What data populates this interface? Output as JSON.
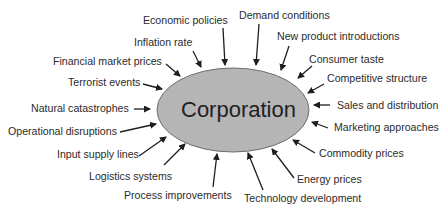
{
  "diagram": {
    "center": {
      "label": "Corporation",
      "fill": "#b5b5b5",
      "stroke": "#6e6e6e"
    },
    "arrow_color": "#1e1e1e",
    "factors": [
      {
        "id": "economic-policies",
        "label": "Economic policies"
      },
      {
        "id": "demand-conditions",
        "label": "Demand conditions"
      },
      {
        "id": "inflation-rate",
        "label": "Inflation rate"
      },
      {
        "id": "new-product-introductions",
        "label": "New product introductions"
      },
      {
        "id": "financial-market-prices",
        "label": "Financial market prices"
      },
      {
        "id": "consumer-taste",
        "label": "Consumer taste"
      },
      {
        "id": "competitive-structure",
        "label": "Competitive structure"
      },
      {
        "id": "terrorist-events",
        "label": "Terrorist events"
      },
      {
        "id": "sales-and-distribution",
        "label": "Sales and distribution"
      },
      {
        "id": "natural-catastrophes",
        "label": "Natural catastrophes"
      },
      {
        "id": "marketing-approaches",
        "label": "Marketing approaches"
      },
      {
        "id": "operational-disruptions",
        "label": "Operational disruptions"
      },
      {
        "id": "commodity-prices",
        "label": "Commodity prices"
      },
      {
        "id": "input-supply-lines",
        "label": "Input supply lines"
      },
      {
        "id": "energy-prices",
        "label": "Energy prices"
      },
      {
        "id": "logistics-systems",
        "label": "Logistics systems"
      },
      {
        "id": "process-improvements",
        "label": "Process improvements"
      },
      {
        "id": "technology-development",
        "label": "Technology development"
      }
    ]
  }
}
